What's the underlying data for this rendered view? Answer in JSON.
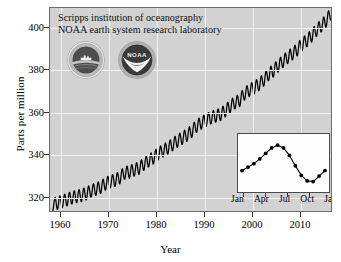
{
  "figure": {
    "header_line1": "Scripps institution of oceanography",
    "header_line2": "NOAA earth system research laboratory",
    "ylabel": "Parts per million",
    "xlabel": "Year",
    "panel_bg": "#d2d2d2",
    "grid_color": "#f2f2f2",
    "curve_color": "#000000"
  },
  "logos": [
    {
      "name": "scripps-logo",
      "alt": "Scripps Institution of Oceanography seal"
    },
    {
      "name": "noaa-logo",
      "alt": "NOAA seal",
      "text": "NOAA"
    }
  ],
  "chart_data": {
    "type": "line",
    "title": "",
    "xlabel": "Year",
    "ylabel": "Parts per million",
    "xlim": [
      1957.5,
      2016.5
    ],
    "ylim": [
      311,
      407
    ],
    "xticks": [
      1960,
      1970,
      1980,
      1990,
      2000,
      2010
    ],
    "yticks": [
      320,
      340,
      360,
      380,
      400
    ],
    "grid": true,
    "legend": "none",
    "series": [
      {
        "name": "Atmospheric CO2 (monthly, Mauna Loa)",
        "note": "annual mean trend with superposed seasonal oscillation of ~6 ppm peak-to-peak",
        "x": [
          1958,
          1959,
          1960,
          1961,
          1962,
          1963,
          1964,
          1965,
          1966,
          1967,
          1968,
          1969,
          1970,
          1971,
          1972,
          1973,
          1974,
          1975,
          1976,
          1977,
          1978,
          1979,
          1980,
          1981,
          1982,
          1983,
          1984,
          1985,
          1986,
          1987,
          1988,
          1989,
          1990,
          1991,
          1992,
          1993,
          1994,
          1995,
          1996,
          1997,
          1998,
          1999,
          2000,
          2001,
          2002,
          2003,
          2004,
          2005,
          2006,
          2007,
          2008,
          2009,
          2010,
          2011,
          2012,
          2013,
          2014,
          2015,
          2016
        ],
        "y": [
          315.0,
          315.6,
          316.4,
          317.2,
          318.1,
          318.7,
          319.2,
          320.0,
          321.3,
          322.1,
          323.0,
          324.6,
          325.7,
          326.3,
          327.5,
          329.7,
          330.2,
          331.1,
          332.0,
          333.8,
          335.4,
          336.8,
          338.7,
          340.1,
          341.4,
          343.0,
          344.6,
          346.0,
          347.4,
          349.2,
          351.6,
          353.1,
          354.4,
          355.6,
          356.4,
          357.1,
          358.8,
          360.8,
          362.6,
          363.7,
          366.7,
          368.4,
          369.6,
          371.1,
          373.2,
          375.8,
          377.5,
          379.8,
          381.9,
          383.8,
          385.6,
          387.4,
          389.9,
          391.7,
          393.9,
          396.5,
          398.6,
          400.8,
          404.2
        ]
      }
    ],
    "inset": {
      "type": "line",
      "title": "",
      "note": "Mean seasonal cycle of CO2 over one year",
      "xlabel": "",
      "ylabel": "",
      "xticklabels": [
        "Jan",
        "Apr",
        "Jul",
        "Oct",
        "Jan"
      ],
      "x": [
        "Nov",
        "Dec",
        "Jan",
        "Feb",
        "Mar",
        "Apr",
        "May",
        "Jun",
        "Jul",
        "Aug",
        "Sep",
        "Oct",
        "Nov",
        "Dec",
        "Jan"
      ],
      "y": [
        -1.1,
        -0.6,
        -0.1,
        0.6,
        1.4,
        2.2,
        2.6,
        2.2,
        1.1,
        -0.4,
        -1.8,
        -2.6,
        -2.7,
        -1.9,
        -1.1
      ],
      "ylim": [
        -3.2,
        3.2
      ],
      "grid": false,
      "markers": true
    }
  },
  "ticks": {
    "y": [
      "400",
      "380",
      "360",
      "340",
      "320"
    ],
    "x": [
      "1960",
      "1970",
      "1980",
      "1990",
      "2000",
      "2010"
    ],
    "inset_x": [
      "Jan",
      "Apr",
      "Jul",
      "Oct",
      "Jan"
    ]
  }
}
